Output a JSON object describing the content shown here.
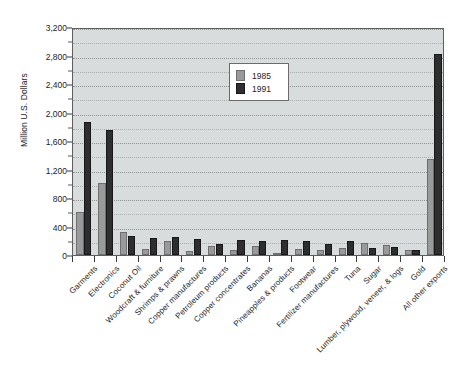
{
  "chart_data": {
    "type": "bar",
    "title": "",
    "xlabel": "",
    "ylabel": "Million U.S. Dollars",
    "ylim": [
      0,
      3200
    ],
    "ytick_step": 400,
    "minor_tick_step": 200,
    "grid": true,
    "legend_position": "upper-center",
    "categories": [
      "Garments",
      "Electronics",
      "Coconut Oil",
      "Woodcraft & furniture",
      "Shrimps & prawns",
      "Copper manufactures",
      "Petroleum products",
      "Copper concentrates",
      "Bananas",
      "Pineapples & products",
      "Footwear",
      "Fertilizer manufactures",
      "Tuna",
      "Sugar",
      "Lumber, plywood, veneer, & logs",
      "Gold",
      "All other exports"
    ],
    "ytick_labels": [
      "0",
      "400",
      "800",
      "1,200",
      "1,600",
      "2,000",
      "2,400",
      "2,800",
      "3,200"
    ],
    "series": [
      {
        "name": "1985",
        "color": "#9a9a9a",
        "values": [
          600,
          1010,
          330,
          80,
          200,
          50,
          130,
          75,
          130,
          25,
          85,
          65,
          100,
          170,
          140,
          75,
          1350
        ]
      },
      {
        "name": "1991",
        "color": "#2e2e2e",
        "values": [
          1870,
          1750,
          270,
          240,
          250,
          225,
          160,
          215,
          200,
          215,
          195,
          150,
          190,
          95,
          110,
          65,
          2820
        ]
      }
    ]
  },
  "legend": {
    "entries": [
      {
        "label": "1985"
      },
      {
        "label": "1991"
      }
    ]
  }
}
